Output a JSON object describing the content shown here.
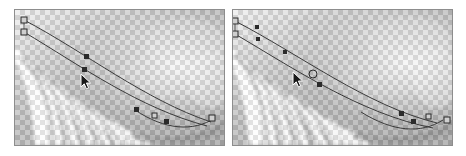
{
  "figure": {
    "title": "Curve path editing before and after comparison",
    "background_color": "#ffffff",
    "width": 466,
    "height": 156,
    "panel_count": 2
  },
  "palette": {
    "page_background": "#ffffff",
    "panel_border": "#8d8d8d",
    "checker_light": "#ffffff",
    "checker_dark": "#b6b6b6",
    "photo_light": "#fefefe",
    "photo_mid": "#9a9a9a",
    "photo_dark": "#6f6f6f",
    "path_stroke": "#3a3a3a",
    "handle_fill": "#cfcfcf",
    "handle_stroke": "#2b2b2b",
    "node_fill": "#2b2b2b",
    "cursor_fill": "#1a1a1a",
    "cursor_outline": "#ffffff"
  },
  "panels": [
    {
      "id": "panel-left",
      "label": "Left panel",
      "caption": "",
      "x": 14,
      "y": 9,
      "width": 211,
      "height": 137,
      "layers": [
        {
          "name": "transparency-checkerboard",
          "label": "Transparency checkerboard",
          "cell_size": 5
        },
        {
          "name": "feather-photo",
          "label": "Blurred grayscale feather texture"
        },
        {
          "name": "path-overlay",
          "label": "Bezier path overlay"
        }
      ],
      "paths": [
        {
          "name": "outer-curve",
          "d": "M 9 10 C 70 42, 130 90, 196 112",
          "stroke": "#3a3a3a",
          "stroke_width": 1
        },
        {
          "name": "inner-curve",
          "d": "M 9 22 C 66 56, 124 98, 192 116",
          "stroke": "#3a3a3a",
          "stroke_width": 1
        },
        {
          "name": "tail-curve",
          "d": "M 120 100 C 150 120, 178 122, 200 108",
          "stroke": "#3a3a3a",
          "stroke_width": 1
        }
      ],
      "handles": [
        {
          "name": "anchor-start-upper",
          "x": 9,
          "y": 10,
          "type": "square"
        },
        {
          "name": "anchor-start-lower",
          "x": 9,
          "y": 22,
          "type": "square"
        },
        {
          "name": "node-mid-upper",
          "x": 72,
          "y": 47,
          "type": "square-filled"
        },
        {
          "name": "node-mid-lower",
          "x": 70,
          "y": 60,
          "type": "square-filled"
        },
        {
          "name": "node-lower-left",
          "x": 122,
          "y": 100,
          "type": "square-filled"
        },
        {
          "name": "node-lower-mid",
          "x": 140,
          "y": 106,
          "type": "square"
        },
        {
          "name": "node-lower-right",
          "x": 152,
          "y": 112,
          "type": "square-filled"
        },
        {
          "name": "anchor-end",
          "x": 197,
          "y": 108,
          "type": "square"
        }
      ],
      "cursor": {
        "name": "arrow-cursor",
        "x": 71,
        "y": 70,
        "kind": "arrow-pointer"
      }
    },
    {
      "id": "panel-right",
      "label": "Right panel",
      "caption": "",
      "x": 232,
      "y": 9,
      "width": 221,
      "height": 137,
      "layers": [
        {
          "name": "transparency-checkerboard",
          "label": "Transparency checkerboard",
          "cell_size": 5
        },
        {
          "name": "feather-photo",
          "label": "Blurred grayscale feather texture"
        },
        {
          "name": "path-overlay",
          "label": "Bezier path overlay"
        }
      ],
      "paths": [
        {
          "name": "outer-curve",
          "d": "M 2 11 C 66 44, 134 96, 204 113",
          "stroke": "#3a3a3a",
          "stroke_width": 1
        },
        {
          "name": "inner-curve",
          "d": "M 2 24 C 60 58, 128 104, 200 118",
          "stroke": "#3a3a3a",
          "stroke_width": 1
        },
        {
          "name": "tail-curve",
          "d": "M 128 102 C 160 122, 188 124, 210 110",
          "stroke": "#3a3a3a",
          "stroke_width": 1
        }
      ],
      "handles": [
        {
          "name": "anchor-start-upper",
          "x": 2,
          "y": 11,
          "type": "square"
        },
        {
          "name": "anchor-start-lower",
          "x": 2,
          "y": 24,
          "type": "square"
        },
        {
          "name": "node-top-upper",
          "x": 24,
          "y": 17,
          "type": "square-filled"
        },
        {
          "name": "node-top-lower",
          "x": 25,
          "y": 29,
          "type": "square-filled"
        },
        {
          "name": "node-mid-upper",
          "x": 52,
          "y": 42,
          "type": "square-filled"
        },
        {
          "name": "node-mid-ring",
          "x": 80,
          "y": 64,
          "type": "circle"
        },
        {
          "name": "node-mid-lower",
          "x": 86,
          "y": 74,
          "type": "square-filled"
        },
        {
          "name": "node-lower-left",
          "x": 168,
          "y": 104,
          "type": "square-filled"
        },
        {
          "name": "node-lower-mid",
          "x": 180,
          "y": 112,
          "type": "square-filled"
        },
        {
          "name": "node-lower-right",
          "x": 196,
          "y": 107,
          "type": "square"
        },
        {
          "name": "anchor-end",
          "x": 214,
          "y": 110,
          "type": "square"
        }
      ],
      "cursor": {
        "name": "arrow-cursor",
        "x": 64,
        "y": 68,
        "kind": "arrow-pointer"
      }
    }
  ]
}
